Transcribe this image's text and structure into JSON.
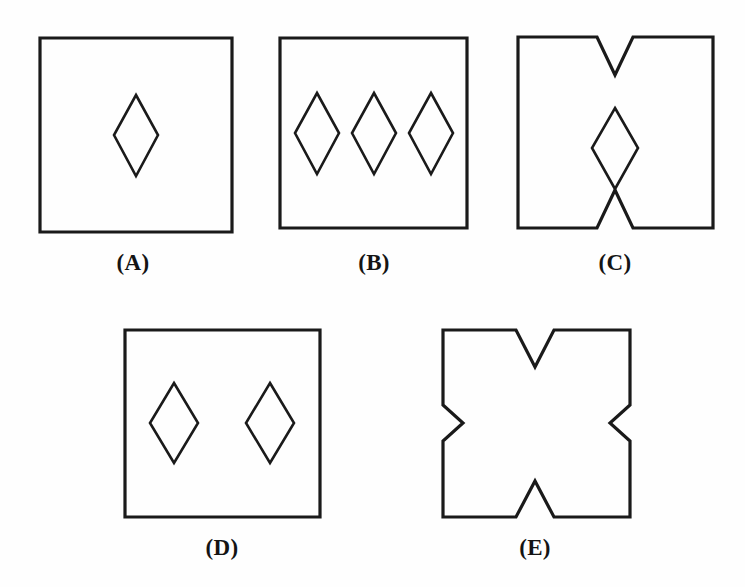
{
  "figure": {
    "background_color": "#fefefe",
    "stroke_color": "#1a1a1a",
    "label_color": "#141414",
    "canvas": {
      "width": 745,
      "height": 587
    }
  },
  "options": [
    {
      "id": "A",
      "label": "(A)",
      "label_x": 133,
      "label_y": 270,
      "description": "Square with one diamond in the center",
      "outline_points": "40,38 232,38 232,232 40,232",
      "inner_shapes": [
        {
          "name": "diamond-center",
          "points": "136,95 158,135 136,176 114,135"
        }
      ]
    },
    {
      "id": "B",
      "label": "(B)",
      "label_x": 374,
      "label_y": 270,
      "description": "Square with three diamonds in a horizontal row",
      "outline_points": "280,38 467,38 467,228 280,228",
      "inner_shapes": [
        {
          "name": "diamond-left",
          "points": "317,93 339,133 317,174 295,133"
        },
        {
          "name": "diamond-middle",
          "points": "374,93 396,133 374,174 352,133"
        },
        {
          "name": "diamond-right",
          "points": "431,93 453,133 431,174 409,133"
        }
      ]
    },
    {
      "id": "C",
      "label": "(C)",
      "label_x": 615,
      "label_y": 270,
      "description": "Square notched with a V on the top and bottom edges, with a diamond in the center",
      "outline_points": "518,37 597,37 615,75 633,37 713,37 713,228 633,228 615,190 597,228 518,228",
      "inner_shapes": [
        {
          "name": "diamond-center",
          "points": "615,108 638,148 615,189 592,148"
        }
      ]
    },
    {
      "id": "D",
      "label": "(D)",
      "label_x": 222,
      "label_y": 555,
      "description": "Square with two diamonds side by side",
      "outline_points": "125,330 320,330 320,517 125,517",
      "inner_shapes": [
        {
          "name": "diamond-left",
          "points": "174,383 198,423 174,463 150,423"
        },
        {
          "name": "diamond-right",
          "points": "270,383 294,423 270,463 246,423"
        }
      ]
    },
    {
      "id": "E",
      "label": "(E)",
      "label_x": 535,
      "label_y": 555,
      "description": "Square notched with a V on all four edges",
      "outline_points": "443,330 516,330 535,367 554,330 630,330 630,405 610,423 630,441 630,517 554,517 535,481 516,517 443,517 443,441 463,423 443,405",
      "inner_shapes": []
    }
  ]
}
